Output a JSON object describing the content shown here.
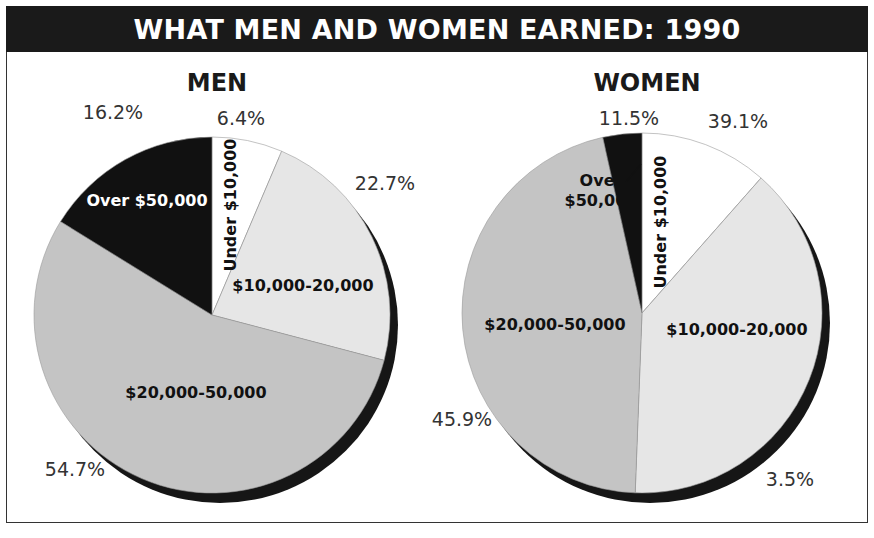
{
  "chart_data": {
    "type": "pie",
    "title": "WHAT MEN AND WOMEN EARNED: 1990",
    "start_angle": "12 o'clock",
    "direction": "clockwise",
    "legend": "none (labels inside slices)",
    "categories": [
      "Under $10,000",
      "$10,000-20,000",
      "$20,000-50,000",
      "Over $50,000"
    ],
    "colors": {
      "Under $10,000": "#ffffff",
      "$10,000-20,000": "#e6e6e6",
      "$20,000-50,000": "#c4c4c4",
      "Over $50,000": "#111111",
      "shadow": "#161616"
    },
    "charts": [
      {
        "name": "MEN",
        "slices": [
          {
            "label": "Under $10,000",
            "value": 6.4,
            "pct_label": "6.4%",
            "label_color": "#111111",
            "rotated": true
          },
          {
            "label": "$10,000-20,000",
            "value": 22.7,
            "pct_label": "22.7%",
            "label_color": "#111111",
            "rotated": false
          },
          {
            "label": "$20,000-50,000",
            "value": 54.7,
            "pct_label": "54.7%",
            "label_color": "#111111",
            "rotated": false
          },
          {
            "label": "Over $50,000",
            "value": 16.2,
            "pct_label": "16.2%",
            "label_color": "#ffffff",
            "rotated": false
          }
        ]
      },
      {
        "name": "WOMEN",
        "slices": [
          {
            "label": "Under $10,000",
            "value": 11.5,
            "pct_label": "11.5%",
            "label_color": "#111111",
            "rotated": true
          },
          {
            "label": "$10,000-20,000",
            "value": 39.1,
            "pct_label": "39.1%",
            "label_color": "#111111",
            "rotated": false
          },
          {
            "label": "$20,000-50,000",
            "value": 45.9,
            "pct_label": "45.9%",
            "label_color": "#111111",
            "rotated": false
          },
          {
            "label": "Over $50,000",
            "value": 3.5,
            "pct_label": "3.5%",
            "label_color": "#111111",
            "rotated": false,
            "callout": true,
            "label_lines": [
              "Over",
              "$50,000"
            ]
          }
        ]
      }
    ]
  }
}
